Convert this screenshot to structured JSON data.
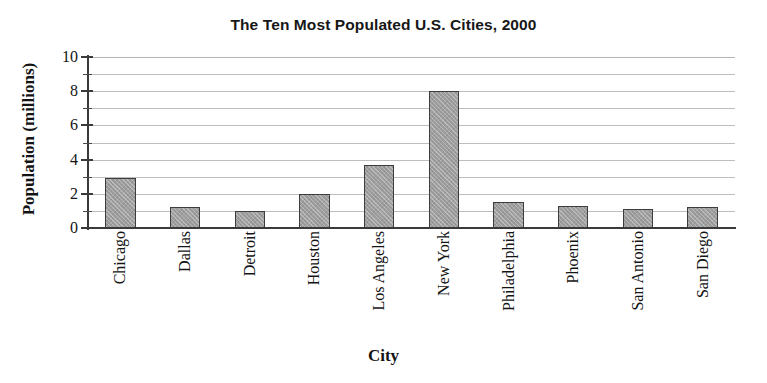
{
  "chart_data": {
    "type": "bar",
    "title": "The Ten Most Populated U.S. Cities, 2000",
    "xlabel": "City",
    "ylabel": "Population (millions)",
    "categories": [
      "Chicago",
      "Dallas",
      "Detroit",
      "Houston",
      "Los Angeles",
      "New York",
      "Philadelphia",
      "Phoenix",
      "San Antonio",
      "San Diego"
    ],
    "values": [
      2.9,
      1.2,
      1.0,
      2.0,
      3.7,
      8.0,
      1.5,
      1.3,
      1.1,
      1.2
    ],
    "ylim": [
      0,
      10
    ],
    "ytick_labels": [
      "0",
      "2",
      "4",
      "6",
      "8",
      "10"
    ],
    "ytick_values": [
      0,
      2,
      4,
      6,
      8,
      10
    ],
    "minor_tick_values": [
      1,
      3,
      5,
      7,
      9
    ],
    "gridline_values": [
      1,
      2,
      3,
      4,
      5,
      6,
      7,
      8,
      9,
      10
    ],
    "grid": true,
    "legend": "none",
    "bar_color": "#9e9e9e",
    "bar_edge_color": "#3d3d3d",
    "axis_color": "#3a3a3a",
    "grid_color": "#bdbdbd",
    "background_color": "#ffffff"
  }
}
